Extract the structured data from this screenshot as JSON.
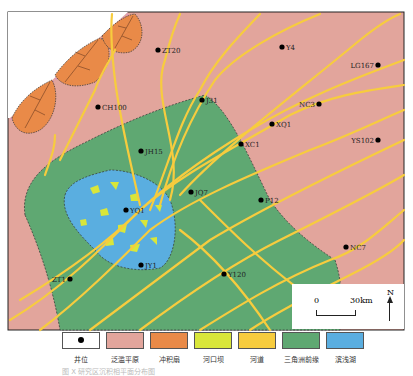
{
  "colors": {
    "floodplain": "#e2a59c",
    "alluvial_fan": "#e98a48",
    "mouth_bar": "#d9e63a",
    "channel": "#f7cc3e",
    "delta_front": "#5fa872",
    "shore_lake": "#5aaee0",
    "well": "#000000"
  },
  "wells": [
    {
      "name": "ZT20",
      "x": 158,
      "y": 50
    },
    {
      "name": "Y4",
      "x": 282,
      "y": 47
    },
    {
      "name": "LG167",
      "x": 378,
      "y": 65
    },
    {
      "name": "CH100",
      "x": 98,
      "y": 107
    },
    {
      "name": "J31",
      "x": 202,
      "y": 100
    },
    {
      "name": "NC3",
      "x": 319,
      "y": 104
    },
    {
      "name": "XQ1",
      "x": 272,
      "y": 124
    },
    {
      "name": "XC1",
      "x": 241,
      "y": 144
    },
    {
      "name": "YS102",
      "x": 378,
      "y": 140
    },
    {
      "name": "JH15",
      "x": 141,
      "y": 151
    },
    {
      "name": "JQ7",
      "x": 191,
      "y": 192
    },
    {
      "name": "YQ1",
      "x": 126,
      "y": 210
    },
    {
      "name": "P12",
      "x": 261,
      "y": 200
    },
    {
      "name": "JY1",
      "x": 141,
      "y": 265
    },
    {
      "name": "NC7",
      "x": 346,
      "y": 247
    },
    {
      "name": "Y120",
      "x": 224,
      "y": 274
    },
    {
      "name": "ZT1",
      "x": 70,
      "y": 279
    }
  ],
  "scale_bar": {
    "start": "0",
    "end": "30km"
  },
  "north_label": "N",
  "legend": [
    {
      "label": "井位",
      "key": "well"
    },
    {
      "label": "泛滥平原",
      "key": "floodplain"
    },
    {
      "label": "冲积扇",
      "key": "alluvial_fan"
    },
    {
      "label": "河口坝",
      "key": "mouth_bar"
    },
    {
      "label": "河道",
      "key": "channel"
    },
    {
      "label": "三角洲前缘",
      "key": "delta_front"
    },
    {
      "label": "滨浅湖",
      "key": "shore_lake"
    }
  ],
  "caption": "图  X  研究区沉积相平面分布图"
}
